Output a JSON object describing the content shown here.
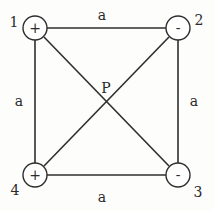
{
  "diagram": {
    "type": "square-charge-configuration",
    "colors": {
      "stroke": "#2e2e2e",
      "text": "#2a2a2a",
      "background": "#fdfdfc"
    },
    "nodes": [
      {
        "id": "1",
        "label": "1",
        "sign": "+",
        "cx": 35,
        "cy": 28
      },
      {
        "id": "2",
        "label": "2",
        "sign": "-",
        "cx": 178,
        "cy": 28
      },
      {
        "id": "3",
        "label": "3",
        "sign": "-",
        "cx": 178,
        "cy": 175
      },
      {
        "id": "4",
        "label": "4",
        "sign": "+",
        "cx": 35,
        "cy": 175
      }
    ],
    "edges": [
      {
        "from": "1",
        "to": "2",
        "label": "a"
      },
      {
        "from": "2",
        "to": "3",
        "label": "a"
      },
      {
        "from": "3",
        "to": "4",
        "label": "a"
      },
      {
        "from": "4",
        "to": "1",
        "label": "a"
      },
      {
        "from": "1",
        "to": "3",
        "label": ""
      },
      {
        "from": "2",
        "to": "4",
        "label": ""
      }
    ],
    "center_point": {
      "label": "P"
    },
    "edge_labels": {
      "top": "a",
      "left": "a",
      "right": "a",
      "bottom": "a"
    }
  }
}
